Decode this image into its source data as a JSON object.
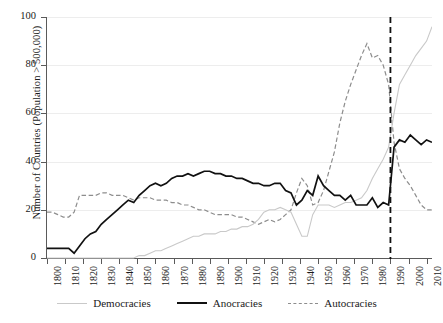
{
  "chart_data": {
    "type": "line",
    "title": "",
    "xlabel": "",
    "ylabel": "Number of Countries (Population > 500,000)",
    "xlim": [
      1800,
      2013
    ],
    "ylim": [
      0,
      100
    ],
    "grid": true,
    "legend_position": "bottom",
    "ytick_labels": [
      "0",
      "20",
      "40",
      "60",
      "80",
      "100"
    ],
    "ytick_values": [
      0,
      20,
      40,
      60,
      80,
      100
    ],
    "xtick_labels": [
      "1800",
      "1810",
      "1820",
      "1830",
      "1840",
      "1850",
      "1860",
      "1870",
      "1880",
      "1890",
      "1900",
      "1910",
      "1920",
      "1930",
      "1940",
      "1950",
      "1960",
      "1970",
      "1980",
      "1990",
      "2000",
      "2010"
    ],
    "xtick_values": [
      1800,
      1810,
      1820,
      1830,
      1840,
      1850,
      1860,
      1870,
      1880,
      1890,
      1900,
      1910,
      1920,
      1930,
      1940,
      1950,
      1960,
      1970,
      1980,
      1990,
      2000,
      2010
    ],
    "annotations": [
      {
        "name": "vertical-reference-line",
        "type": "vline",
        "x": 1990,
        "style": "dashed",
        "color": "#111111"
      }
    ],
    "colors": {
      "democracies": "#c9c9c9",
      "anocracies": "#111111",
      "autocracies": "#8d8d8d",
      "gridline": "#ededed",
      "axis": "#5a5a5a",
      "background": "#ffffff"
    },
    "x": [
      1800,
      1803,
      1806,
      1809,
      1812,
      1815,
      1818,
      1821,
      1824,
      1827,
      1830,
      1833,
      1836,
      1839,
      1842,
      1845,
      1848,
      1851,
      1854,
      1857,
      1860,
      1863,
      1866,
      1869,
      1872,
      1875,
      1878,
      1881,
      1884,
      1887,
      1890,
      1893,
      1896,
      1899,
      1902,
      1905,
      1908,
      1911,
      1914,
      1917,
      1920,
      1923,
      1926,
      1929,
      1932,
      1935,
      1938,
      1941,
      1944,
      1947,
      1950,
      1953,
      1956,
      1959,
      1962,
      1965,
      1968,
      1971,
      1974,
      1977,
      1980,
      1983,
      1986,
      1989,
      1992,
      1995,
      1998,
      2001,
      2004,
      2007,
      2010,
      2013
    ],
    "series": [
      {
        "name": "Democracies",
        "style": "solid",
        "color": "#c9c9c9",
        "values": [
          0,
          0,
          0,
          0,
          0,
          0,
          0,
          0,
          0,
          0,
          0,
          0,
          0,
          0,
          0,
          0,
          0,
          1,
          1,
          2,
          3,
          3,
          4,
          5,
          6,
          7,
          8,
          9,
          9,
          10,
          10,
          10,
          11,
          11,
          12,
          12,
          13,
          13,
          14,
          16,
          19,
          20,
          20,
          21,
          20,
          19,
          14,
          9,
          9,
          18,
          22,
          22,
          22,
          21,
          22,
          23,
          23,
          24,
          25,
          28,
          33,
          37,
          41,
          46,
          60,
          72,
          76,
          80,
          84,
          87,
          90,
          96
        ]
      },
      {
        "name": "Anocracies",
        "style": "solid",
        "color": "#111111",
        "values": [
          4,
          4,
          4,
          4,
          4,
          2,
          5,
          8,
          10,
          11,
          14,
          16,
          18,
          20,
          22,
          24,
          23,
          26,
          28,
          30,
          31,
          30,
          31,
          33,
          34,
          34,
          35,
          34,
          35,
          36,
          36,
          35,
          35,
          34,
          34,
          33,
          33,
          32,
          31,
          31,
          30,
          30,
          31,
          31,
          28,
          27,
          22,
          24,
          28,
          26,
          34,
          30,
          28,
          26,
          26,
          24,
          26,
          22,
          22,
          22,
          25,
          21,
          23,
          22,
          46,
          49,
          48,
          51,
          49,
          47,
          49,
          48
        ]
      },
      {
        "name": "Autocracies",
        "style": "dashed",
        "color": "#8d8d8d",
        "values": [
          19,
          19,
          18,
          17,
          17,
          19,
          26,
          26,
          26,
          26,
          27,
          27,
          26,
          26,
          26,
          25,
          24,
          25,
          25,
          25,
          24,
          24,
          24,
          23,
          23,
          22,
          22,
          21,
          20,
          20,
          19,
          18,
          18,
          18,
          18,
          17,
          17,
          16,
          15,
          14,
          15,
          16,
          15,
          16,
          18,
          20,
          27,
          33,
          30,
          22,
          23,
          28,
          36,
          44,
          56,
          65,
          72,
          78,
          84,
          89,
          83,
          84,
          80,
          72,
          48,
          37,
          33,
          30,
          26,
          22,
          20,
          20
        ]
      }
    ]
  },
  "legend": {
    "items": [
      {
        "label": "Democracies",
        "key": "dem"
      },
      {
        "label": "Anocracies",
        "key": "ano"
      },
      {
        "label": "Autocracies",
        "key": "aut"
      }
    ]
  },
  "axes": {
    "y_axis_title": "Number of Countries (Population > 500,000)"
  }
}
